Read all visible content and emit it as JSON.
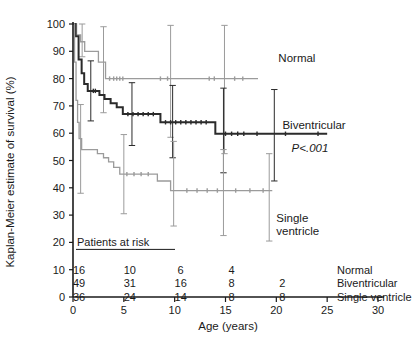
{
  "chart_data": {
    "type": "line",
    "title": "",
    "xlabel": "Age (years)",
    "ylabel": "Kaplan-Meier estimate of survival (%)",
    "xlim": [
      0,
      30
    ],
    "ylim": [
      0,
      100
    ],
    "xticks": [
      0,
      5,
      10,
      15,
      20,
      25,
      30
    ],
    "xticklabels": [
      "0",
      "5",
      "10",
      "15",
      "20",
      "25",
      "30"
    ],
    "yticks": [
      0,
      10,
      20,
      30,
      40,
      50,
      60,
      70,
      80,
      90,
      100
    ],
    "yticklabels": [
      "0",
      "10",
      "20",
      "30",
      "40",
      "50",
      "60",
      "70",
      "80",
      "90",
      "100"
    ],
    "grid": false,
    "legend_position": "inline-right-of-curve",
    "annotations": [
      {
        "name": "p-value",
        "text": "P<.001",
        "x": 21.5,
        "y": 53
      }
    ],
    "series": [
      {
        "name": "Normal",
        "color": "#9b9b9b",
        "stroke_width": 1.3,
        "label": "Normal",
        "label_x": 20.2,
        "label_y": 86,
        "steps": [
          [
            0.0,
            100
          ],
          [
            0.35,
            100
          ],
          [
            0.35,
            96
          ],
          [
            0.75,
            96
          ],
          [
            0.75,
            93.5
          ],
          [
            1.15,
            93.5
          ],
          [
            1.15,
            90
          ],
          [
            2.5,
            90
          ],
          [
            2.5,
            86
          ],
          [
            3.2,
            86
          ],
          [
            3.2,
            80
          ],
          [
            18.2,
            80
          ]
        ],
        "censor_marks": [
          [
            3.6,
            80
          ],
          [
            4.0,
            80
          ],
          [
            4.3,
            80
          ],
          [
            4.6,
            80
          ],
          [
            4.9,
            80
          ],
          [
            8.6,
            80
          ],
          [
            9.3,
            80
          ],
          [
            13.4,
            80
          ],
          [
            13.9,
            80
          ],
          [
            15.9,
            80
          ],
          [
            16.7,
            80
          ]
        ],
        "error_bars": [
          {
            "x": 0.9,
            "lo": 88.0,
            "hi": 100.0
          },
          {
            "x": 3.0,
            "lo": 67.5,
            "hi": 99.0
          },
          {
            "x": 9.6,
            "lo": 58.5,
            "hi": 99.5
          },
          {
            "x": 14.9,
            "lo": 52.5,
            "hi": 99.5
          }
        ]
      },
      {
        "name": "Biventricular",
        "color": "#2b2b2b",
        "stroke_width": 2.0,
        "label": "Biventricular",
        "label_x": 20.6,
        "label_y": 61.5,
        "steps": [
          [
            0.0,
            100
          ],
          [
            0.25,
            100
          ],
          [
            0.25,
            95.5
          ],
          [
            0.55,
            95.5
          ],
          [
            0.55,
            87
          ],
          [
            0.85,
            87
          ],
          [
            0.85,
            82
          ],
          [
            1.1,
            82
          ],
          [
            1.1,
            78
          ],
          [
            1.45,
            78
          ],
          [
            1.45,
            75.5
          ],
          [
            2.6,
            75.5
          ],
          [
            2.6,
            74
          ],
          [
            3.1,
            74
          ],
          [
            3.1,
            72.5
          ],
          [
            3.7,
            72.5
          ],
          [
            3.7,
            71
          ],
          [
            4.3,
            71
          ],
          [
            4.3,
            69.5
          ],
          [
            4.9,
            69.5
          ],
          [
            4.9,
            67
          ],
          [
            8.6,
            67
          ],
          [
            8.6,
            64
          ],
          [
            14.0,
            64
          ],
          [
            14.0,
            59.8
          ],
          [
            25.0,
            59.8
          ]
        ],
        "censor_marks": [
          [
            2.0,
            75.5
          ],
          [
            2.2,
            75.5
          ],
          [
            5.4,
            67
          ],
          [
            5.9,
            67
          ],
          [
            6.4,
            67
          ],
          [
            6.9,
            67
          ],
          [
            7.4,
            67
          ],
          [
            7.9,
            67
          ],
          [
            9.1,
            64
          ],
          [
            9.6,
            64
          ],
          [
            10.1,
            64
          ],
          [
            10.6,
            64
          ],
          [
            11.1,
            64
          ],
          [
            11.6,
            64
          ],
          [
            12.1,
            64
          ],
          [
            12.6,
            64
          ],
          [
            13.1,
            64
          ],
          [
            15.0,
            59.8
          ],
          [
            15.6,
            59.8
          ],
          [
            16.2,
            59.8
          ],
          [
            16.8,
            59.8
          ],
          [
            18.1,
            59.8
          ],
          [
            20.9,
            59.8
          ],
          [
            24.1,
            59.8
          ]
        ],
        "error_bars": [
          {
            "x": 1.75,
            "lo": 64.5,
            "hi": 86.5
          },
          {
            "x": 5.8,
            "lo": 55.5,
            "hi": 78.5
          },
          {
            "x": 9.8,
            "lo": 51.0,
            "hi": 77.5
          },
          {
            "x": 14.8,
            "lo": 45.5,
            "hi": 76.5
          },
          {
            "x": 19.8,
            "lo": 42.5,
            "hi": 76.0
          }
        ]
      },
      {
        "name": "Single ventricle",
        "color": "#9b9b9b",
        "stroke_width": 1.3,
        "label": "Single\nventricle",
        "label_x": 20.0,
        "label_y": 27.5,
        "steps": [
          [
            0.0,
            100
          ],
          [
            0.15,
            100
          ],
          [
            0.15,
            86
          ],
          [
            0.3,
            86
          ],
          [
            0.3,
            72
          ],
          [
            0.45,
            72
          ],
          [
            0.45,
            64
          ],
          [
            0.6,
            64
          ],
          [
            0.6,
            58
          ],
          [
            0.85,
            58
          ],
          [
            0.85,
            54
          ],
          [
            2.4,
            54
          ],
          [
            2.4,
            52.5
          ],
          [
            3.0,
            52.5
          ],
          [
            3.0,
            51
          ],
          [
            3.5,
            51
          ],
          [
            3.5,
            49.5
          ],
          [
            4.0,
            49.5
          ],
          [
            4.0,
            47.5
          ],
          [
            4.6,
            47.5
          ],
          [
            4.6,
            45
          ],
          [
            8.3,
            45
          ],
          [
            8.3,
            42.5
          ],
          [
            9.6,
            42.5
          ],
          [
            9.6,
            39
          ],
          [
            19.6,
            39
          ]
        ],
        "censor_marks": [
          [
            5.3,
            45
          ],
          [
            6.0,
            45
          ],
          [
            6.7,
            45
          ],
          [
            7.4,
            45
          ],
          [
            11.2,
            39
          ],
          [
            12.2,
            39
          ],
          [
            13.2,
            39
          ],
          [
            14.2,
            39
          ],
          [
            16.0,
            39
          ],
          [
            17.4,
            39
          ],
          [
            18.7,
            39
          ]
        ],
        "error_bars": [
          {
            "x": 0.75,
            "lo": 38.0,
            "hi": 70.5
          },
          {
            "x": 5.0,
            "lo": 30.5,
            "hi": 59.5
          },
          {
            "x": 9.9,
            "lo": 26.0,
            "hi": 57.0
          },
          {
            "x": 14.8,
            "lo": 22.5,
            "hi": 54.0
          },
          {
            "x": 19.3,
            "lo": 20.5,
            "hi": 52.5
          }
        ]
      }
    ],
    "risk_table": {
      "title": "Patients at risk",
      "times": [
        0,
        5,
        10,
        15,
        20
      ],
      "rows": [
        {
          "label": "Normal",
          "counts": [
            "16",
            "10",
            "6",
            "4",
            ""
          ]
        },
        {
          "label": "Biventricular",
          "counts": [
            "49",
            "31",
            "16",
            "8",
            "2"
          ]
        },
        {
          "label": "Single ventricle",
          "counts": [
            "36",
            "24",
            "14",
            "8",
            "8"
          ]
        }
      ]
    }
  }
}
